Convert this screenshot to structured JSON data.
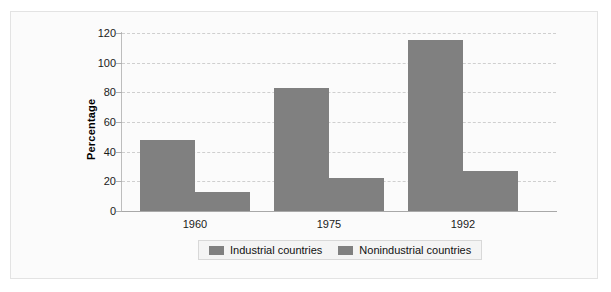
{
  "chart_data": {
    "type": "bar",
    "title": "",
    "xlabel": "",
    "ylabel": "Percentage",
    "categories": [
      "1960",
      "1975",
      "1992"
    ],
    "series": [
      {
        "name": "Industrial countries",
        "values": [
          48,
          83,
          115
        ],
        "color": "#808080"
      },
      {
        "name": "Nonindustrial countries",
        "values": [
          13,
          22,
          27
        ],
        "color": "#808080"
      }
    ],
    "ylim": [
      0,
      120
    ],
    "ytick_labels": [
      "0",
      "20",
      "40",
      "60",
      "80",
      "100",
      "120"
    ],
    "ytick_values": [
      0,
      20,
      40,
      60,
      80,
      100,
      120
    ],
    "grid": true,
    "grid_style": "dashed-horizontal",
    "legend_position": "bottom-center",
    "legend_entries": [
      "Industrial countries",
      "Nonindustrial countries"
    ]
  },
  "colors": {
    "bar": "#808080",
    "gridline": "#cfcfcf",
    "axis": "#b0b0b0",
    "frame": "#e3e3e3",
    "plot_background": "#fbfbfb",
    "legend_background": "#f4f4f4",
    "text": "#1a1a1a"
  }
}
